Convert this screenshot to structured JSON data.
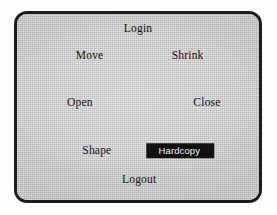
{
  "figure": {
    "kind": "pie-menu",
    "frame": {
      "shape": "rounded-rectangle",
      "border_color": "#1c1c1c",
      "surface_color": "#c9c9c9"
    },
    "page_background": "#fdfdfd"
  },
  "menu": {
    "selected_item": "Hardcopy",
    "item_count": 8,
    "text_color": "#131313",
    "highlight_background": "#111111",
    "highlight_text_color": "#f2f2f2",
    "items": [
      {
        "label": "Login",
        "direction": "north",
        "selected": false
      },
      {
        "label": "Shrink",
        "direction": "northeast",
        "selected": false
      },
      {
        "label": "Close",
        "direction": "east",
        "selected": false
      },
      {
        "label": "Hardcopy",
        "direction": "southeast",
        "selected": true
      },
      {
        "label": "Logout",
        "direction": "south",
        "selected": false
      },
      {
        "label": "Shape",
        "direction": "southwest",
        "selected": false
      },
      {
        "label": "Open",
        "direction": "west",
        "selected": false
      },
      {
        "label": "Move",
        "direction": "northwest",
        "selected": false
      }
    ]
  }
}
